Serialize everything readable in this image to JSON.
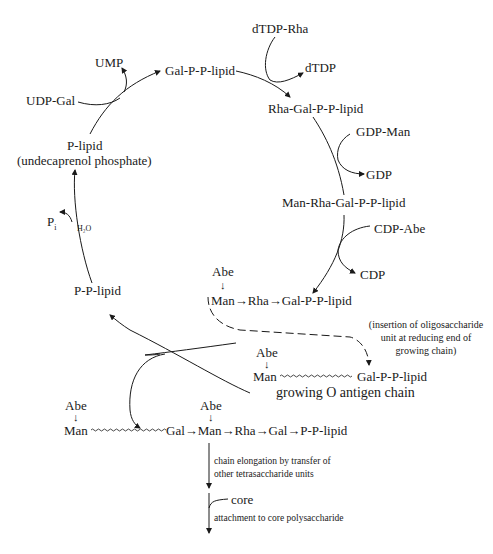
{
  "diagram": {
    "cycle": {
      "p_lipid": "P-lipid",
      "p_lipid_note": "(undecaprenol phosphate)",
      "udp_gal": "UDP-Gal",
      "ump": "UMP",
      "gal_pp_lipid": "Gal-P-P-lipid",
      "dtdp_rha": "dTDP-Rha",
      "dtdp": "dTDP",
      "rha_gal_pp_lipid": "Rha-Gal-P-P-lipid",
      "gdp_man": "GDP-Man",
      "gdp": "GDP",
      "man_rha_gal_pp_lipid": "Man-Rha-Gal-P-P-lipid",
      "cdp_abe": "CDP-Abe",
      "cdp": "CDP",
      "pp_lipid": "P-P-lipid",
      "pi": "P",
      "pi_sub": "i",
      "h2o": "H₂O"
    },
    "tetrasaccharide": {
      "abe": "Abe",
      "down_arrow": "↓",
      "chain": "Man→Rha→Gal-P-P-lipid"
    },
    "insertion_note": [
      "(insertion of oligosaccharide",
      "unit at reducing end of",
      "growing chain)"
    ],
    "growing_chain": {
      "abe": "Abe",
      "down_arrow": "↓",
      "man": "Man",
      "gal_pp_lipid": "Gal-P-P-lipid",
      "caption": "growing O antigen chain"
    },
    "elongated_chain": {
      "abe1": "Abe",
      "abe2": "Abe",
      "down_arrow": "↓",
      "man": "Man",
      "rest": "Gal→Man→Rha→Gal→P-P-lipid"
    },
    "steps": {
      "elongation": [
        "chain elongation by transfer of",
        "other tetrasaccharide units"
      ],
      "core": "core",
      "attachment": "attachment to core polysaccharide"
    }
  }
}
